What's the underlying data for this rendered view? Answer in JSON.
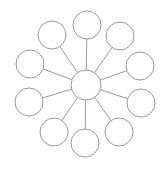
{
  "diagram": {
    "type": "hub-and-spoke",
    "width": 164,
    "height": 171,
    "stroke_color": "#9a9a9a",
    "fill_color": "#ffffff",
    "stroke_width": 1,
    "hub": {
      "cx": 86,
      "cy": 85,
      "r": 15,
      "label": ""
    },
    "nodes": [
      {
        "id": "top",
        "cx": 87,
        "cy": 25,
        "r": 14,
        "label": ""
      },
      {
        "id": "top-right",
        "cx": 120,
        "cy": 36,
        "r": 14,
        "label": ""
      },
      {
        "id": "right-upper",
        "cx": 140,
        "cy": 66,
        "r": 14,
        "label": ""
      },
      {
        "id": "right-lower",
        "cx": 141,
        "cy": 103,
        "r": 14,
        "label": ""
      },
      {
        "id": "bottom-right",
        "cx": 119,
        "cy": 132,
        "r": 14,
        "label": ""
      },
      {
        "id": "bottom",
        "cx": 85,
        "cy": 143,
        "r": 14,
        "label": ""
      },
      {
        "id": "bottom-left",
        "cx": 54,
        "cy": 132,
        "r": 14,
        "label": ""
      },
      {
        "id": "left-lower",
        "cx": 29,
        "cy": 102,
        "r": 14,
        "label": ""
      },
      {
        "id": "left-upper",
        "cx": 30,
        "cy": 64,
        "r": 14,
        "label": ""
      },
      {
        "id": "top-left",
        "cx": 52,
        "cy": 35,
        "r": 14,
        "label": ""
      }
    ]
  }
}
